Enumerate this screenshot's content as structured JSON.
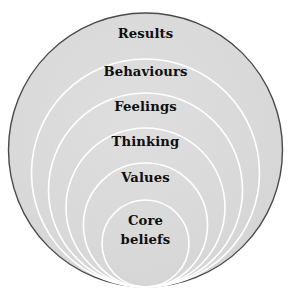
{
  "diagram": {
    "type": "concentric-tangent-circles",
    "canvas": {
      "width": 291,
      "height": 301,
      "background": "#ffffff"
    },
    "style": {
      "fill_color": "#d9d9d9",
      "outer_stroke_color": "#4a4a4a",
      "inner_stroke_color": "#ffffff",
      "text_color": "#110f0d",
      "outer_stroke_width": 1.4,
      "inner_stroke_width": 1.6
    },
    "geometry": {
      "bottom_tangent_y": 287,
      "center_x": 145.5,
      "note": "All circles are internally tangent at a common bottom point"
    },
    "layers": [
      {
        "id": "results",
        "label": "Results",
        "radius": 137,
        "top_y": 13,
        "level": 1
      },
      {
        "id": "behaviours",
        "label": "Behaviours",
        "radius": 114,
        "top_y": 59,
        "level": 2
      },
      {
        "id": "feelings",
        "label": "Feelings",
        "radius": 97,
        "top_y": 93,
        "level": 3
      },
      {
        "id": "thinking",
        "label": "Thinking",
        "radius": 79.5,
        "top_y": 128,
        "level": 4
      },
      {
        "id": "values",
        "label": "Values",
        "radius": 62,
        "top_y": 163,
        "level": 5
      },
      {
        "id": "core",
        "label": "Core\nbeliefs",
        "radius": 43.5,
        "top_y": 200,
        "level": 6
      }
    ]
  }
}
